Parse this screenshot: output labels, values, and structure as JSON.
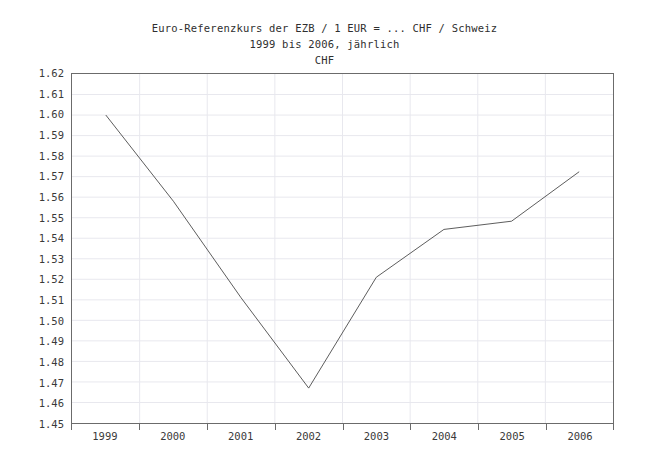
{
  "chart_data": {
    "type": "line",
    "title": "Euro-Referenzkurs der EZB / 1 EUR = ... CHF / Schweiz",
    "subtitle": "1999 bis 2006, jährlich",
    "series_label": "CHF",
    "xlabel": "",
    "ylabel": "CHF",
    "categories": [
      "1999",
      "2000",
      "2001",
      "2002",
      "2003",
      "2004",
      "2005",
      "2006"
    ],
    "values": [
      1.6,
      1.558,
      1.511,
      1.467,
      1.521,
      1.5443,
      1.5483,
      1.5724
    ],
    "series": [
      {
        "name": "CHF",
        "values": [
          1.6,
          1.558,
          1.511,
          1.467,
          1.521,
          1.5443,
          1.5483,
          1.5724
        ]
      }
    ],
    "ylim": [
      1.45,
      1.62
    ],
    "ytick_step": 0.01,
    "ytick_labels": [
      "1.62",
      "1.61",
      "1.60",
      "1.59",
      "1.58",
      "1.57",
      "1.56",
      "1.55",
      "1.54",
      "1.53",
      "1.52",
      "1.51",
      "1.50",
      "1.49",
      "1.48",
      "1.47",
      "1.46",
      "1.45"
    ],
    "xtick_labels": [
      "1999",
      "2000",
      "2001",
      "2002",
      "2003",
      "2004",
      "2005",
      "2006"
    ],
    "grid": true,
    "legend": "none",
    "line_color": "#4a4a4a",
    "grid_color": "#e8e8ee",
    "axis_color": "#6b6b6b"
  },
  "titles": {
    "line1": "Euro-Referenzkurs der EZB / 1 EUR = ... CHF / Schweiz",
    "line2": "1999 bis 2006, jährlich",
    "line3": "CHF"
  }
}
